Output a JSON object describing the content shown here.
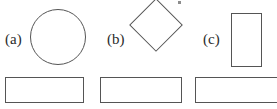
{
  "figure": {
    "width": 277,
    "height": 109,
    "background_color": "#ffffff",
    "stroke_color": "#555555",
    "text_color": "#2b2b2b"
  },
  "panels": [
    {
      "label": "(a)",
      "label_x": 5,
      "label_y": 32,
      "shape": {
        "name": "circle",
        "type": "circle",
        "x": 30,
        "y": 9,
        "width": 56,
        "height": 56,
        "rotation_deg": 0
      },
      "ground": {
        "name": "ground-block",
        "x": 5,
        "y": 77,
        "width": 79,
        "height": 26
      }
    },
    {
      "label": "(b)",
      "label_x": 107,
      "label_y": 32,
      "shape": {
        "name": "diamond",
        "type": "square-rotated",
        "x": 137,
        "y": 6,
        "width": 38,
        "height": 38,
        "rotation_deg": 45
      },
      "ground": {
        "name": "ground-block",
        "x": 100,
        "y": 77,
        "width": 82,
        "height": 26
      }
    },
    {
      "label": "(c)",
      "label_x": 203,
      "label_y": 32,
      "shape": {
        "name": "upright-rectangle",
        "type": "rectangle",
        "x": 231,
        "y": 13,
        "width": 31,
        "height": 54,
        "rotation_deg": 0
      },
      "ground": {
        "name": "ground-block",
        "x": 195,
        "y": 77,
        "width": 88,
        "height": 26
      }
    }
  ],
  "artifact": {
    "name": "crop-speck",
    "x": 178,
    "y": 1,
    "width": 3,
    "height": 3
  }
}
